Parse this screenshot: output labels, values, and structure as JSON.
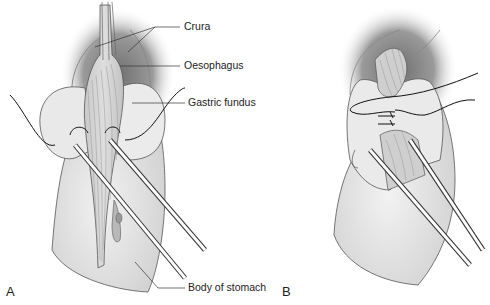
{
  "figure": {
    "panels": [
      {
        "id": "A",
        "label": "A",
        "description": "Fundus wrapped around oesophagus with sutures, crura shown above"
      },
      {
        "id": "B",
        "label": "B",
        "description": "Completed fundoplication with sutures tied"
      }
    ],
    "annotations": [
      {
        "key": "crura",
        "text": "Crura"
      },
      {
        "key": "oesophagus",
        "text": "Oesophagus"
      },
      {
        "key": "gastric_fundus",
        "text": "Gastric fundus"
      },
      {
        "key": "body_of_stomach",
        "text": "Body of stomach"
      }
    ],
    "colors": {
      "tissue": "#e4e4e4",
      "tissue_dark": "#bdbdbd",
      "shadow": "#7a7a7a",
      "outline": "#444444",
      "instrument": "#ffffff",
      "suture": "#111111"
    }
  }
}
